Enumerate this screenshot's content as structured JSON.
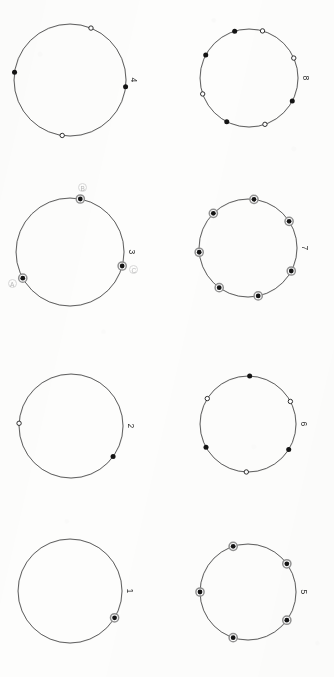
{
  "sheet": {
    "title": "Circle point configurations",
    "background_color": "#fdfdfc",
    "ink_color": "#3a3a3a",
    "faint_label_color": "#b9b9b9",
    "columns": 2,
    "rows": 4
  },
  "chart_data": {
    "type": "scatter",
    "subtitle": "Eight circles with marked points, numbered 1 through 8",
    "xlabel": "",
    "ylabel": "",
    "grid": false,
    "legend": "none",
    "layout": "2 columns x 4 rows, labels rotated 90 degrees at right of each circle",
    "marker_types": {
      "filled": "solid black dot",
      "open": "white dot with black outline",
      "ringed": "solid black dot inside a gray ring"
    },
    "figures": [
      {
        "label": "4",
        "grid_position": {
          "row": 1,
          "col": 1
        },
        "point_count": 4,
        "circle": {
          "cx": 70,
          "cy": 80,
          "r": 56
        },
        "points": [
          {
            "angle_deg": 68,
            "type": "open",
            "letter": ""
          },
          {
            "angle_deg": 172,
            "type": "filled",
            "letter": ""
          },
          {
            "angle_deg": 262,
            "type": "open",
            "letter": ""
          },
          {
            "angle_deg": 353,
            "type": "filled",
            "letter": ""
          }
        ]
      },
      {
        "label": "8",
        "grid_position": {
          "row": 1,
          "col": 2
        },
        "point_count": 8,
        "circle": {
          "cx": 82,
          "cy": 78,
          "r": 49
        },
        "points": [
          {
            "angle_deg": 74,
            "type": "open",
            "letter": ""
          },
          {
            "angle_deg": 107,
            "type": "filled",
            "letter": ""
          },
          {
            "angle_deg": 152,
            "type": "filled",
            "letter": ""
          },
          {
            "angle_deg": 199,
            "type": "open",
            "letter": ""
          },
          {
            "angle_deg": 243,
            "type": "filled",
            "letter": ""
          },
          {
            "angle_deg": 289,
            "type": "open",
            "letter": ""
          },
          {
            "angle_deg": 332,
            "type": "filled",
            "letter": ""
          },
          {
            "angle_deg": 24,
            "type": "open",
            "letter": ""
          }
        ]
      },
      {
        "label": "3",
        "grid_position": {
          "row": 2,
          "col": 1
        },
        "point_count": 3,
        "circle": {
          "cx": 70,
          "cy": 82,
          "r": 54
        },
        "points": [
          {
            "angle_deg": 79,
            "type": "ringed",
            "letter": "B"
          },
          {
            "angle_deg": 209,
            "type": "ringed",
            "letter": "A"
          },
          {
            "angle_deg": 345,
            "type": "ringed",
            "letter": "C"
          }
        ]
      },
      {
        "label": "7",
        "grid_position": {
          "row": 2,
          "col": 2
        },
        "point_count": 7,
        "circle": {
          "cx": 81,
          "cy": 78,
          "r": 49
        },
        "points": [
          {
            "angle_deg": 83,
            "type": "ringed",
            "letter": ""
          },
          {
            "angle_deg": 135,
            "type": "ringed",
            "letter": ""
          },
          {
            "angle_deg": 185,
            "type": "ringed",
            "letter": ""
          },
          {
            "angle_deg": 234,
            "type": "ringed",
            "letter": ""
          },
          {
            "angle_deg": 282,
            "type": "ringed",
            "letter": ""
          },
          {
            "angle_deg": 332,
            "type": "ringed",
            "letter": ""
          },
          {
            "angle_deg": 33,
            "type": "ringed",
            "letter": ""
          }
        ]
      },
      {
        "label": "2",
        "grid_position": {
          "row": 3,
          "col": 1
        },
        "point_count": 2,
        "circle": {
          "cx": 71,
          "cy": 86,
          "r": 52
        },
        "points": [
          {
            "angle_deg": 177,
            "type": "open",
            "letter": ""
          },
          {
            "angle_deg": 324,
            "type": "filled",
            "letter": ""
          }
        ]
      },
      {
        "label": "6",
        "grid_position": {
          "row": 3,
          "col": 2
        },
        "point_count": 6,
        "circle": {
          "cx": 81,
          "cy": 84,
          "r": 48
        },
        "points": [
          {
            "angle_deg": 88,
            "type": "filled",
            "letter": ""
          },
          {
            "angle_deg": 148,
            "type": "open",
            "letter": ""
          },
          {
            "angle_deg": 209,
            "type": "filled",
            "letter": ""
          },
          {
            "angle_deg": 268,
            "type": "open",
            "letter": ""
          },
          {
            "angle_deg": 328,
            "type": "filled",
            "letter": ""
          },
          {
            "angle_deg": 28,
            "type": "open",
            "letter": ""
          }
        ]
      },
      {
        "label": "1",
        "grid_position": {
          "row": 4,
          "col": 1
        },
        "point_count": 1,
        "circle": {
          "cx": 70,
          "cy": 81,
          "r": 52
        },
        "points": [
          {
            "angle_deg": 329,
            "type": "ringed",
            "letter": ""
          }
        ]
      },
      {
        "label": "5",
        "grid_position": {
          "row": 4,
          "col": 2
        },
        "point_count": 5,
        "circle": {
          "cx": 81,
          "cy": 82,
          "r": 48
        },
        "points": [
          {
            "angle_deg": 108,
            "type": "ringed",
            "letter": ""
          },
          {
            "angle_deg": 180,
            "type": "ringed",
            "letter": ""
          },
          {
            "angle_deg": 252,
            "type": "ringed",
            "letter": ""
          },
          {
            "angle_deg": 324,
            "type": "ringed",
            "letter": ""
          },
          {
            "angle_deg": 36,
            "type": "ringed",
            "letter": ""
          }
        ]
      }
    ]
  }
}
